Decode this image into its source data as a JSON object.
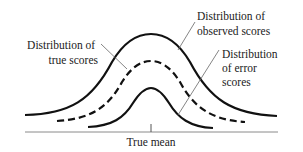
{
  "diagram": {
    "title": "",
    "axis_label": "True mean",
    "labels": {
      "observed": [
        "Distribution of",
        "observed scores"
      ],
      "true": [
        "Distribution of",
        "true scores"
      ],
      "error": [
        "Distribution",
        "of error",
        "scores"
      ]
    },
    "curves": [
      {
        "name": "observed scores",
        "style": "solid",
        "relative_height": "largest",
        "relative_spread": "widest"
      },
      {
        "name": "true scores",
        "style": "dashed",
        "relative_height": "middle",
        "relative_spread": "middle"
      },
      {
        "name": "error scores",
        "style": "solid",
        "relative_height": "smallest",
        "relative_spread": "narrowest"
      }
    ],
    "colors": {
      "line": "#111111",
      "axis": "#888888",
      "leader": "#666666",
      "text": "#222222"
    }
  }
}
